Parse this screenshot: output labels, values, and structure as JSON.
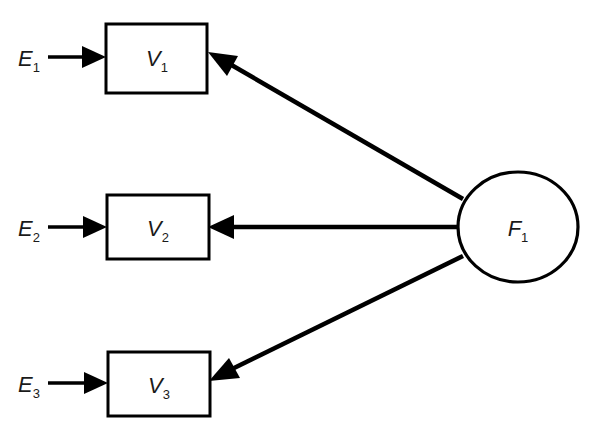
{
  "diagram": {
    "type": "sem-path-diagram",
    "background_color": "#ffffff",
    "stroke_color": "#000000",
    "width": 591,
    "height": 437,
    "factors": [
      {
        "id": "F1",
        "label_base": "F",
        "label_sub": "1",
        "shape": "ellipse",
        "cx": 518,
        "cy": 227,
        "rx": 60,
        "ry": 55
      }
    ],
    "indicators": [
      {
        "id": "V1",
        "label_base": "V",
        "label_sub": "1",
        "shape": "rect",
        "x": 106,
        "y": 24,
        "width": 101,
        "height": 69
      },
      {
        "id": "V2",
        "label_base": "V",
        "label_sub": "2",
        "shape": "rect",
        "x": 107,
        "y": 195,
        "width": 102,
        "height": 64
      },
      {
        "id": "V3",
        "label_base": "V",
        "label_sub": "3",
        "shape": "rect",
        "x": 108,
        "y": 352,
        "width": 102,
        "height": 64
      }
    ],
    "errors": [
      {
        "id": "E1",
        "label_base": "E",
        "label_sub": "1",
        "x": 18,
        "y": 66,
        "target": "V1"
      },
      {
        "id": "E2",
        "label_base": "E",
        "label_sub": "2",
        "x": 18,
        "y": 236,
        "target": "V2"
      },
      {
        "id": "E3",
        "label_base": "E",
        "label_sub": "3",
        "x": 18,
        "y": 392,
        "target": "V3"
      }
    ],
    "paths": [
      {
        "id": "E1-V1",
        "from": "E1",
        "to": "V1",
        "kind": "error-path",
        "style": "thin"
      },
      {
        "id": "E2-V2",
        "from": "E2",
        "to": "V2",
        "kind": "error-path",
        "style": "thin"
      },
      {
        "id": "E3-V3",
        "from": "E3",
        "to": "V3",
        "kind": "error-path",
        "style": "thin"
      },
      {
        "id": "F1-V1",
        "from": "F1",
        "to": "V1",
        "kind": "factor-loading",
        "style": "thick"
      },
      {
        "id": "F1-V2",
        "from": "F1",
        "to": "V2",
        "kind": "factor-loading",
        "style": "thick"
      },
      {
        "id": "F1-V3",
        "from": "F1",
        "to": "V3",
        "kind": "factor-loading",
        "style": "thick"
      }
    ]
  }
}
